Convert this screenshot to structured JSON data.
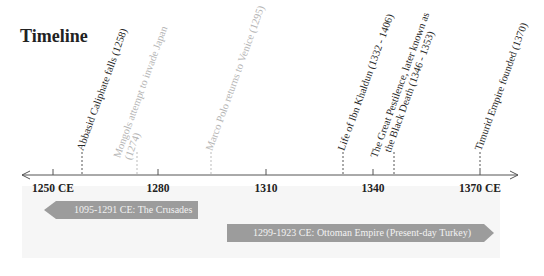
{
  "title": "Timeline",
  "axis": {
    "ticks": [
      {
        "label": "1250 CE",
        "x": 53
      },
      {
        "label": "1280",
        "x": 158
      },
      {
        "label": "1310",
        "x": 266
      },
      {
        "label": "1340",
        "x": 373
      },
      {
        "label": "1370 CE",
        "x": 480
      }
    ]
  },
  "events": [
    {
      "label": "Abbasid Caliphate falls (1258)",
      "x": 82,
      "style": "dark"
    },
    {
      "label": "Mongols attempt to invade Japan",
      "label2": "(1274)",
      "x": 137,
      "style": "light"
    },
    {
      "label": "Marco Polo returns to Venice (1295)",
      "x": 211,
      "style": "light"
    },
    {
      "label": "Life of Ibn Khaldun (1332 - 1406)",
      "x": 343,
      "style": "dark"
    },
    {
      "label": "The Great Pestilence, later known as",
      "label2": "the Black Death (1346 - 1353)",
      "x": 394,
      "style": "dark"
    },
    {
      "label": "Timurid Empire founded (1370)",
      "x": 480,
      "style": "dark"
    }
  ],
  "eras": [
    {
      "label": "1095-1291 CE: The Crusades",
      "direction": "left"
    },
    {
      "label": "1299-1923 CE: Ottoman Empire (Present-day Turkey)",
      "direction": "right"
    }
  ],
  "colors": {
    "axis": "#555555",
    "era_bar": "#9c9c9c",
    "panel": "#f6f6f6",
    "dark_text": "#2a2a2a",
    "light_text": "#b5b5b5"
  }
}
